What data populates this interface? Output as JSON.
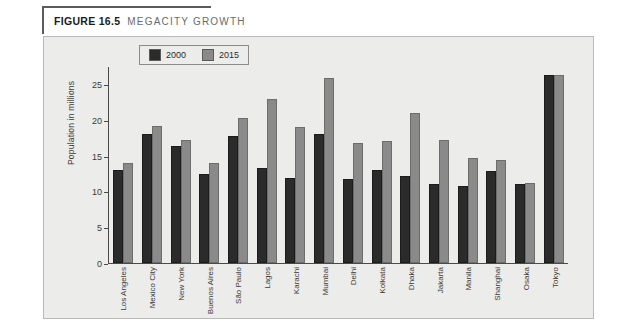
{
  "caption": {
    "figure_number": "FIGURE 16.5",
    "title": "MEGACITY GROWTH"
  },
  "legend": {
    "position": "top-center",
    "items": [
      {
        "label": "2000",
        "color": "#2b2b2b",
        "icon": "square-swatch"
      },
      {
        "label": "2015",
        "color": "#8a8a8a",
        "icon": "square-swatch"
      }
    ]
  },
  "axes": {
    "ylabel": "Population in millions",
    "yticks": [
      "0",
      "5",
      "10",
      "15",
      "20",
      "25"
    ]
  },
  "chart_data": {
    "type": "bar",
    "title": "MEGACITY GROWTH",
    "xlabel": "",
    "ylabel": "Population in millions",
    "ylim": [
      0,
      27.5
    ],
    "yticks": [
      0,
      5,
      10,
      15,
      20,
      25
    ],
    "grid": false,
    "legend_position": "top-center",
    "categories": [
      "Los Angeles",
      "Mexico City",
      "New York",
      "Buenos Aires",
      "São Paulo",
      "Lagos",
      "Karachi",
      "Mumbai",
      "Delhi",
      "Kolkata",
      "Dhaka",
      "Jakarta",
      "Manila",
      "Shanghai",
      "Osaka",
      "Tokyo"
    ],
    "series": [
      {
        "name": "2000",
        "color": "#2b2b2b",
        "values": [
          13.0,
          18.0,
          16.3,
          12.4,
          17.7,
          13.2,
          11.8,
          18.0,
          11.7,
          13.0,
          12.2,
          11.0,
          10.8,
          12.8,
          11.0,
          26.3
        ]
      },
      {
        "name": "2015",
        "color": "#8a8a8a",
        "values": [
          14.0,
          19.1,
          17.2,
          13.9,
          20.2,
          22.9,
          19.0,
          25.8,
          16.7,
          17.1,
          21.0,
          17.2,
          14.7,
          14.4,
          11.2,
          26.2
        ]
      }
    ]
  }
}
